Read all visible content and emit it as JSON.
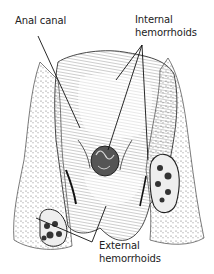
{
  "figure": {
    "labels": {
      "anal_canal": "Anal canal",
      "internal_line1": "Internal",
      "internal_line2": "hemorrhoids",
      "external_line1": "External",
      "external_line2": "hemorrhoids"
    },
    "colors": {
      "ink": "#222222",
      "background": "#ffffff",
      "shade": "#888888"
    }
  }
}
